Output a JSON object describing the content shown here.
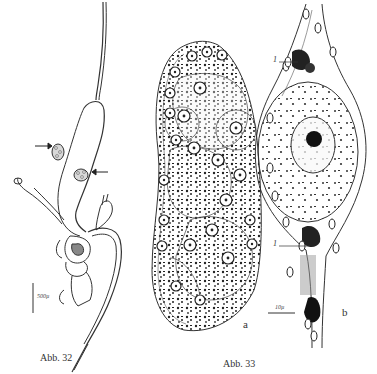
{
  "figures": [
    {
      "id": "abb32",
      "caption": "Abb. 32",
      "scale_bar_label": "500µ",
      "arrow_count": 2
    },
    {
      "id": "abb33",
      "caption": "Abb. 33",
      "panel_labels": [
        "a",
        "b"
      ],
      "scale_bar_label": "10µ",
      "callout_labels": [
        "1",
        "1"
      ]
    }
  ]
}
